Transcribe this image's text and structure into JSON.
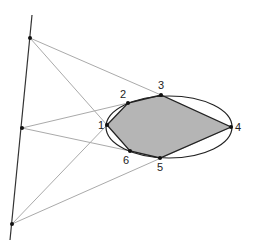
{
  "diagram": {
    "type": "polygon inscribed in ellipse with external projection lines",
    "external_line": {
      "x1": 32,
      "y1": 15,
      "x2": 10,
      "y2": 240
    },
    "external_points": [
      {
        "x": 30,
        "y": 38
      },
      {
        "x": 22,
        "y": 128
      },
      {
        "x": 12,
        "y": 224
      }
    ],
    "ellipse": {
      "cx": 169,
      "cy": 127,
      "rx": 63,
      "ry": 31
    },
    "polygon_fill": "#b5b5b5",
    "vertices": [
      {
        "label": "1",
        "x": 107,
        "y": 125,
        "lx": 98,
        "ly": 129
      },
      {
        "label": "2",
        "x": 128,
        "y": 103,
        "lx": 120,
        "ly": 98
      },
      {
        "label": "3",
        "x": 161,
        "y": 95,
        "lx": 158,
        "ly": 89
      },
      {
        "label": "4",
        "x": 231,
        "y": 127,
        "lx": 235,
        "ly": 131
      },
      {
        "label": "5",
        "x": 160,
        "y": 158,
        "lx": 157,
        "ly": 171
      },
      {
        "label": "6",
        "x": 130,
        "y": 151,
        "lx": 123,
        "ly": 164
      }
    ],
    "projection_lines": [
      [
        0,
        2
      ],
      [
        0,
        0
      ],
      [
        1,
        1
      ],
      [
        1,
        5
      ],
      [
        2,
        3
      ],
      [
        2,
        0
      ]
    ]
  }
}
